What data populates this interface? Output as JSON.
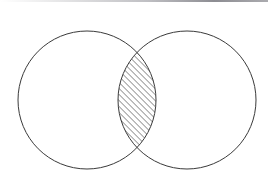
{
  "figure": {
    "background_color": "#ffffff",
    "width": 268,
    "height": 187,
    "stroke_color": "#3a3a3a",
    "stroke_width": 1,
    "hatch_color": "#2b2b2b",
    "hatch_angle_deg": 45,
    "hatch_spacing_px": 3,
    "hatch_line_width": 0.9
  },
  "chart_data": {
    "type": "diagram",
    "diagram_type": "venn",
    "title": "",
    "xlabel": "",
    "ylabel": "",
    "sets": [
      {
        "name": "left-set",
        "label": "",
        "center_x": 87,
        "center_y": 100,
        "radius": 69,
        "fill": "none",
        "stroke": "#3a3a3a"
      },
      {
        "name": "right-set",
        "label": "",
        "center_x": 187,
        "center_y": 100,
        "radius": 69,
        "fill": "none",
        "stroke": "#3a3a3a"
      }
    ],
    "regions": [
      {
        "name": "left-only",
        "shaded": false,
        "fill": "none"
      },
      {
        "name": "right-only",
        "shaded": false,
        "fill": "none"
      },
      {
        "name": "intersection",
        "shaded": true,
        "fill": "diagonal-hatch",
        "bounds": {
          "x_min": 118,
          "x_max": 156,
          "y_min": 53,
          "y_max": 148
        }
      }
    ],
    "annotations": [],
    "legend": {
      "visible": false,
      "position": "none"
    },
    "grid": false
  },
  "artifacts": {
    "top_scan_line": {
      "name": "scan-edge-line",
      "visible": true,
      "color": "#8a8a8e"
    }
  }
}
